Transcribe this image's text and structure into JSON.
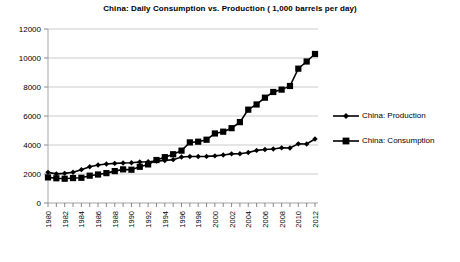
{
  "chart_data": {
    "type": "line",
    "title": "China: Daily Consumption vs. Production ( 1,000 barrels per day)",
    "xlabel": "",
    "ylabel": "",
    "ylim": [
      0,
      12000
    ],
    "xlim": [
      1980,
      2012
    ],
    "grid": true,
    "legend_position": "right",
    "ytick_labels": [
      "0",
      "2000",
      "4000",
      "6000",
      "8000",
      "10000",
      "12000"
    ],
    "ytick_values": [
      0,
      2000,
      4000,
      6000,
      8000,
      10000,
      12000
    ],
    "xtick_labels": [
      "1980",
      "1982",
      "1984",
      "1986",
      "1988",
      "1990",
      "1992",
      "1994",
      "1996",
      "1998",
      "2000",
      "2002",
      "2004",
      "2006",
      "2008",
      "2010",
      "2012"
    ],
    "x": [
      1980,
      1981,
      1982,
      1983,
      1984,
      1985,
      1986,
      1987,
      1988,
      1989,
      1990,
      1991,
      1992,
      1993,
      1994,
      1995,
      1996,
      1997,
      1998,
      1999,
      2000,
      2001,
      2002,
      2003,
      2004,
      2005,
      2006,
      2007,
      2008,
      2009,
      2010,
      2011,
      2012
    ],
    "series": [
      {
        "name": "China: Production",
        "marker": "diamond",
        "values": [
          2114,
          2012,
          2045,
          2120,
          2300,
          2505,
          2620,
          2690,
          2730,
          2760,
          2774,
          2830,
          2840,
          2890,
          2930,
          2990,
          3170,
          3211,
          3212,
          3213,
          3252,
          3306,
          3390,
          3401,
          3485,
          3627,
          3686,
          3728,
          3805,
          3796,
          4078,
          4074,
          4416
        ]
      },
      {
        "name": "China: Consumption",
        "marker": "square",
        "values": [
          1765,
          1705,
          1675,
          1720,
          1740,
          1885,
          1965,
          2060,
          2200,
          2320,
          2296,
          2498,
          2662,
          2964,
          3161,
          3363,
          3610,
          4179,
          4228,
          4364,
          4796,
          4918,
          5160,
          5578,
          6437,
          6795,
          7264,
          7656,
          7819,
          8070,
          9265,
          9758,
          10277
        ]
      }
    ]
  },
  "legend": {
    "entries": [
      {
        "label": "China: Production",
        "marker": "diamond"
      },
      {
        "label": "China: Consumption",
        "marker": "square"
      }
    ]
  }
}
